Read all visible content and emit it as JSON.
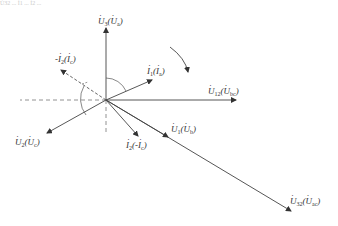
{
  "figure": {
    "type": "phasor-diagram",
    "cropped_top_text": "U̇32 ... İ1 ... İ2 ...",
    "colors": {
      "line": "#444444",
      "dashed": "#666666",
      "text": "#333333"
    },
    "origin": [
      106,
      100
    ],
    "vectors": [
      {
        "id": "U3",
        "main": "U",
        "sub": "3",
        "alt_main": "U",
        "alt_sub": "a",
        "style": "solid",
        "end": [
          106,
          27
        ]
      },
      {
        "id": "U12",
        "main": "U",
        "sub": "12",
        "alt_main": "U",
        "alt_sub": "bc",
        "style": "solid",
        "end": [
          236,
          100
        ]
      },
      {
        "id": "U2",
        "main": "U",
        "sub": "2",
        "alt_main": "U",
        "alt_sub": "c",
        "style": "solid",
        "end": [
          46,
          134
        ]
      },
      {
        "id": "U1",
        "main": "U",
        "sub": "1",
        "alt_main": "U",
        "alt_sub": "b",
        "style": "solid",
        "end": [
          168,
          125
        ]
      },
      {
        "id": "U32",
        "main": "U",
        "sub": "32",
        "alt_main": "U",
        "alt_sub": "ac",
        "style": "solid",
        "end": [
          292,
          212
        ]
      },
      {
        "id": "I1",
        "main": "I",
        "sub": "1",
        "alt_main": "I",
        "alt_sub": "a",
        "style": "solid",
        "end": [
          150,
          80
        ]
      },
      {
        "id": "negI2",
        "main": "-I",
        "sub": "2",
        "alt_main": "I",
        "alt_sub": "c",
        "style": "dashed",
        "end": [
          60,
          70
        ]
      },
      {
        "id": "I2",
        "main": "I",
        "sub": "2",
        "alt_main": "-I",
        "alt_sub": "c",
        "style": "solid",
        "end": [
          138,
          136
        ]
      }
    ],
    "labels": {
      "U3": {
        "main": "U",
        "sub": "3",
        "alt": "U",
        "alt_sub": "a"
      },
      "U12": {
        "main": "U",
        "sub": "12",
        "alt": "U",
        "alt_sub": "bc"
      },
      "U2": {
        "main": "U",
        "sub": "2",
        "alt": "U",
        "alt_sub": "c"
      },
      "U1": {
        "main": "U",
        "sub": "1",
        "alt": "U",
        "alt_sub": "b"
      },
      "U32": {
        "main": "U",
        "sub": "32",
        "alt": "U",
        "alt_sub": "ac"
      },
      "I1": {
        "main": "I",
        "sub": "1",
        "alt": "I",
        "alt_sub": "a"
      },
      "negI2": {
        "prefix": "-",
        "main": "I",
        "sub": "2",
        "alt": "I",
        "alt_sub": "c"
      },
      "I2": {
        "main": "I",
        "sub": "2",
        "alt_prefix": "-",
        "alt": "I",
        "alt_sub": "c"
      }
    },
    "rotation_arrow": "clockwise"
  }
}
